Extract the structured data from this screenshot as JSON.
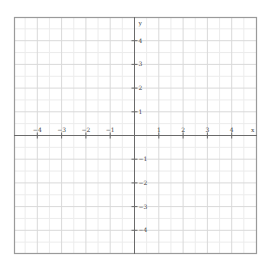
{
  "chart_data": {
    "type": "scatter",
    "title": "",
    "xlabel": "x",
    "ylabel": "y",
    "xlim": [
      -5,
      5
    ],
    "ylim": [
      -5,
      5
    ],
    "grid": true,
    "minor_grid": true,
    "x_ticks": [
      -4,
      -3,
      -2,
      -1,
      1,
      2,
      3,
      4
    ],
    "y_ticks": [
      -4,
      -3,
      -2,
      -1,
      1,
      2,
      3,
      4
    ],
    "x_tick_labels": [
      "−4",
      "−3",
      "−2",
      "−1",
      "1",
      "2",
      "3",
      "4"
    ],
    "y_tick_labels": [
      "−4",
      "−3",
      "−2",
      "−1",
      "1",
      "2",
      "3",
      "4"
    ],
    "series": [],
    "legend": null
  },
  "plane": {
    "x_axis_label": "x",
    "y_axis_label": "y"
  },
  "colors": {
    "border": "#9a9a9a",
    "major_grid": "#d9d9d9",
    "minor_grid": "#ececec",
    "axis": "#6a6a6a",
    "label": "#444444"
  }
}
